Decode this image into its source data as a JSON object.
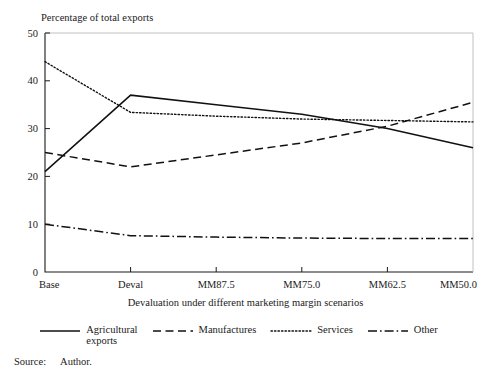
{
  "figure": {
    "clipped_header": "",
    "y_axis_caption": "Percentage of total exports",
    "x_axis_title": "Devaluation under different marketing margin scenarios",
    "source_label": "Source:",
    "source_value": "Author."
  },
  "chart_data": {
    "type": "line",
    "title": "",
    "xlabel": "Devaluation under different marketing margin scenarios",
    "ylabel": "Percentage of total exports",
    "categories": [
      "Base",
      "Deval",
      "MM87.5",
      "MM75.0",
      "MM62.5",
      "MM50.0"
    ],
    "ylim": [
      0,
      50
    ],
    "yticks": [
      0,
      10,
      20,
      30,
      40,
      50
    ],
    "grid": false,
    "legend_position": "bottom",
    "series": [
      {
        "name": "Agricultural exports",
        "style": "solid",
        "values": [
          21.0,
          37.0,
          35.0,
          33.0,
          30.0,
          26.0
        ]
      },
      {
        "name": "Manufactures",
        "style": "dashed",
        "values": [
          25.0,
          22.0,
          24.5,
          27.0,
          30.5,
          35.5
        ]
      },
      {
        "name": "Services",
        "style": "dotted",
        "values": [
          44.0,
          33.4,
          32.6,
          32.0,
          31.7,
          31.4
        ]
      },
      {
        "name": "Other",
        "style": "dashdot",
        "values": [
          10.0,
          7.6,
          7.3,
          7.1,
          7.0,
          7.0
        ]
      }
    ]
  },
  "legend": {
    "items": [
      {
        "label": "Agricultural\nexports",
        "style": "solid",
        "name": "agricultural-exports"
      },
      {
        "label": "Manufactures",
        "style": "dashed",
        "name": "manufactures"
      },
      {
        "label": "Services",
        "style": "dotted",
        "name": "services"
      },
      {
        "label": "Other",
        "style": "dashdot",
        "name": "other"
      }
    ]
  }
}
